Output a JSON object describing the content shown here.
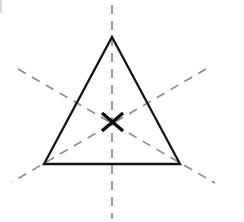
{
  "figure": {
    "background_color": "#ffffff",
    "width": 244,
    "height": 222,
    "shape_name": "equilateral-triangle",
    "shape_color": "#121212",
    "shape_stroke_width": 2.3,
    "axis_color": "#8e8e8e",
    "axis_stroke_width": 1.7,
    "axis_dash_pattern": "9 7",
    "center_mark_color": "#0d0d0d",
    "center_mark_stroke_width": 3.4,
    "artifact_color": "#b9b9b9"
  },
  "geometry": {
    "centroid": {
      "x": 112,
      "y": 122
    },
    "vertices": [
      {
        "name": "apex",
        "x": 112,
        "y": 37
      },
      {
        "name": "bottom-left",
        "x": 44,
        "y": 164
      },
      {
        "name": "bottom-right",
        "x": 180,
        "y": 164
      }
    ],
    "triangle_path": "M 112 37 L 180 164 L 44 164 Z",
    "symmetry_axes": [
      {
        "name": "vertical-axis",
        "x1": 112,
        "y1": 5,
        "x2": 112,
        "y2": 219
      },
      {
        "name": "left-diagonal-axis",
        "x1": 18,
        "y1": 69,
        "x2": 215,
        "y2": 183
      },
      {
        "name": "right-diagonal-axis",
        "x1": 206,
        "y1": 69,
        "x2": 12,
        "y2": 182
      }
    ],
    "center_mark": {
      "name": "centroid-x-mark",
      "stroke_1": {
        "x1": 102,
        "y1": 113,
        "x2": 123,
        "y2": 131
      },
      "stroke_2": {
        "x1": 123,
        "y1": 113,
        "x2": 102,
        "y2": 131
      }
    },
    "crop_artifact": {
      "name": "edge-crop-remnant",
      "x": 0,
      "y": 0,
      "width": 2,
      "height": 13
    }
  }
}
